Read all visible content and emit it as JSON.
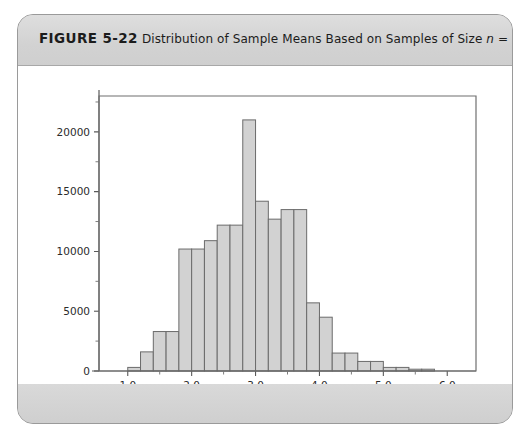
{
  "figure": {
    "number_label": "FIGURE 5-22",
    "caption_part1": "Distribution of Sample Means Based on Samples of Size ",
    "caption_var": "n",
    "caption_part2": " = 10"
  },
  "colors": {
    "bar_fill": "#d2d2d2",
    "bar_stroke": "#6b6b6b",
    "card_band": "#d3d3d3",
    "panel": "#ffffff",
    "axis": "#5a5a5a"
  },
  "chart_data": {
    "type": "bar",
    "title": "Distribution of Sample Means Based on Samples of Size n = 10",
    "xlabel": "",
    "ylabel": "",
    "grid": false,
    "legend": "none",
    "xlim": [
      0.55,
      6.45
    ],
    "ylim": [
      0,
      23000
    ],
    "bin_width": 0.2,
    "x_ticks": [
      1.0,
      2.0,
      3.0,
      4.0,
      5.0,
      6.0
    ],
    "x_tick_labels": [
      "1.0",
      "2.0",
      "3.0",
      "4.0",
      "5.0",
      "6.0"
    ],
    "x_minor_ticks": [
      1.5,
      2.5,
      3.5,
      4.5,
      5.5
    ],
    "y_ticks": [
      0,
      5000,
      10000,
      15000,
      20000
    ],
    "y_tick_labels": [
      "0",
      "5000",
      "10000",
      "15000",
      "20000"
    ],
    "y_minor_ticks": [
      2500,
      7500,
      12500,
      17500,
      22500
    ],
    "bin_centers": [
      0.9,
      1.1,
      1.3,
      1.5,
      1.7,
      1.9,
      2.1,
      2.3,
      2.5,
      2.7,
      2.9,
      3.1,
      3.3,
      3.5,
      3.7,
      3.9,
      4.1,
      4.3,
      4.5,
      4.7,
      4.9,
      5.1,
      5.3,
      5.5,
      5.7,
      5.9
    ],
    "categories": [
      "0.9",
      "1.1",
      "1.3",
      "1.5",
      "1.7",
      "1.9",
      "2.1",
      "2.3",
      "2.5",
      "2.7",
      "2.9",
      "3.1",
      "3.3",
      "3.5",
      "3.7",
      "3.9",
      "4.1",
      "4.3",
      "4.5",
      "4.7",
      "4.9",
      "5.1",
      "5.3",
      "5.5",
      "5.7",
      "5.9"
    ],
    "values": [
      0,
      300,
      1600,
      3300,
      3300,
      10200,
      10200,
      10900,
      12200,
      12200,
      21000,
      14200,
      12700,
      13500,
      13500,
      5700,
      4500,
      1500,
      1500,
      800,
      800,
      300,
      300,
      150,
      150,
      0
    ]
  }
}
